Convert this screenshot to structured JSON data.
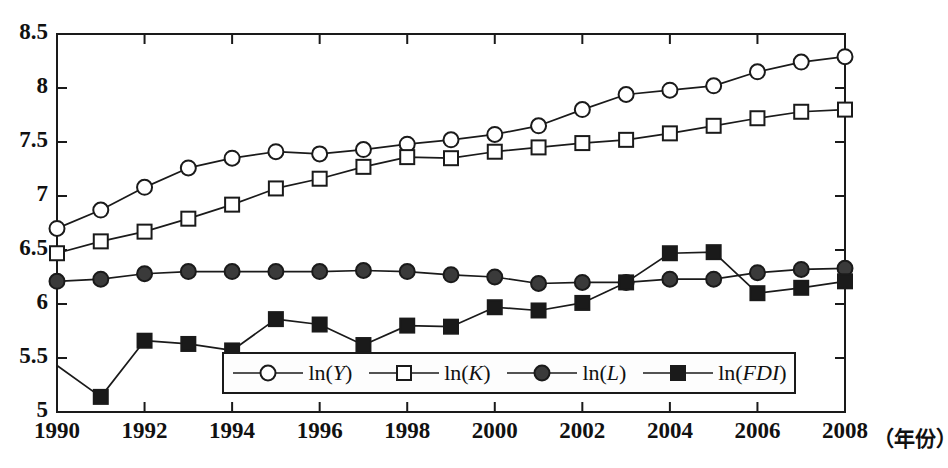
{
  "chart_data": {
    "type": "line",
    "title": "",
    "subtitle": "",
    "xlabel": "（年份）",
    "ylabel": "",
    "xlim": [
      1990,
      2008
    ],
    "ylim": [
      5,
      8.5
    ],
    "grid": false,
    "legend_position": "bottom-center",
    "x": [
      1990,
      1991,
      1992,
      1993,
      1994,
      1995,
      1996,
      1997,
      1998,
      1999,
      2000,
      2001,
      2002,
      2003,
      2004,
      2005,
      2006,
      2007,
      2008
    ],
    "xticks": [
      "1990",
      "1992",
      "1994",
      "1996",
      "1998",
      "2000",
      "2002",
      "2004",
      "2006",
      "2008"
    ],
    "xtick_values": [
      1990,
      1992,
      1994,
      1996,
      1998,
      2000,
      2002,
      2004,
      2006,
      2008
    ],
    "yticks": [
      "5",
      "5.5",
      "6",
      "6.5",
      "7",
      "7.5",
      "8",
      "8.5"
    ],
    "ytick_values": [
      5,
      5.5,
      6,
      6.5,
      7,
      7.5,
      8,
      8.5
    ],
    "series": [
      {
        "name": "ln(Y)",
        "name_prefix": "ln(",
        "name_italic": "Y",
        "name_suffix": ")",
        "marker": "open-circle",
        "color": "#1a1a1a",
        "values": [
          6.7,
          6.87,
          7.08,
          7.26,
          7.35,
          7.41,
          7.39,
          7.43,
          7.48,
          7.52,
          7.57,
          7.65,
          7.8,
          7.94,
          7.98,
          8.02,
          8.15,
          8.24,
          8.29
        ]
      },
      {
        "name": "ln(K)",
        "name_prefix": "ln(",
        "name_italic": "K",
        "name_suffix": ")",
        "marker": "open-square",
        "color": "#1a1a1a",
        "values": [
          6.47,
          6.58,
          6.67,
          6.79,
          6.92,
          7.07,
          7.16,
          7.27,
          7.36,
          7.35,
          7.41,
          7.45,
          7.49,
          7.52,
          7.58,
          7.65,
          7.72,
          7.78,
          7.8
        ]
      },
      {
        "name": "ln(L)",
        "name_prefix": "ln(",
        "name_italic": "L",
        "name_suffix": ")",
        "marker": "filled-circle",
        "color": "#1a1a1a",
        "values": [
          6.21,
          6.23,
          6.28,
          6.3,
          6.3,
          6.3,
          6.3,
          6.31,
          6.3,
          6.27,
          6.25,
          6.19,
          6.2,
          6.2,
          6.23,
          6.23,
          6.29,
          6.32,
          6.33
        ]
      },
      {
        "name": "ln(FDI)",
        "name_prefix": "ln(",
        "name_italic": "FDI",
        "name_suffix": ")",
        "marker": "filled-square",
        "color": "#1a1a1a",
        "values": [
          5.43,
          5.14,
          5.66,
          5.63,
          5.57,
          5.86,
          5.81,
          5.62,
          5.8,
          5.79,
          5.97,
          5.94,
          6.01,
          6.2,
          6.47,
          6.48,
          6.1,
          6.15,
          6.21
        ]
      }
    ]
  },
  "legend": {
    "entries": [
      {
        "label_prefix": "ln(",
        "label_italic": "Y",
        "label_suffix": ")",
        "marker": "open-circle"
      },
      {
        "label_prefix": "ln(",
        "label_italic": "K",
        "label_suffix": ")",
        "marker": "open-square"
      },
      {
        "label_prefix": "ln(",
        "label_italic": "L",
        "label_suffix": ")",
        "marker": "filled-circle"
      },
      {
        "label_prefix": "ln(",
        "label_italic": "FDI",
        "label_suffix": ")",
        "marker": "filled-square"
      }
    ]
  },
  "axes": {
    "frame_color": "#1a1a1a",
    "text_color": "#111111"
  }
}
